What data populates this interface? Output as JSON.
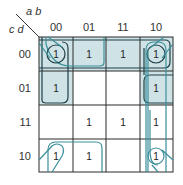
{
  "kmap": {
    "row_variables": "c d",
    "col_variables": "a b",
    "col_labels": [
      "00",
      "01",
      "11",
      "10"
    ],
    "row_labels": [
      "00",
      "01",
      "11",
      "10"
    ],
    "cells": [
      [
        "1",
        "1",
        "1",
        "1"
      ],
      [
        "1",
        "",
        "",
        "1"
      ],
      [
        "",
        "1",
        "1",
        "1"
      ],
      [
        "1",
        "1",
        "",
        "1"
      ]
    ],
    "colors": {
      "grid": "#2a2a2a",
      "shade": "#cfe3e6",
      "loop_dark": "#1f3f46",
      "loop_teal": "#3a8f99"
    }
  }
}
